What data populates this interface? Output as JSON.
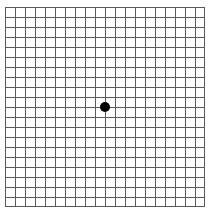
{
  "chart": {
    "name": "Amsler grid",
    "title": "Amsler Grid",
    "type": "grid-chart",
    "background_color": "#ffffff",
    "line_color": "#5a5a5a",
    "border_color": "#5a5a5a",
    "dot_color": "#000000"
  },
  "grid": {
    "columns": 20,
    "rows": 20,
    "cell_width_px": 10,
    "cell_height_px": 10,
    "origin_x_px": 5,
    "origin_y_px": 7,
    "width_px": 200,
    "height_px": 200,
    "line_width_px": 1,
    "border_width_px": 1
  },
  "fixation_dot": {
    "label": "central fixation dot",
    "center_x_px": 105,
    "center_y_px": 107,
    "diameter_px": 10
  },
  "chart_data": {
    "type": "grid",
    "title": "Amsler Grid",
    "subtitle": "",
    "xlabel": "",
    "ylabel": "",
    "grid": true,
    "legend_position": "none",
    "columns": 20,
    "rows": 20,
    "x": [
      0,
      1,
      2,
      3,
      4,
      5,
      6,
      7,
      8,
      9,
      10,
      11,
      12,
      13,
      14,
      15,
      16,
      17,
      18,
      19,
      20
    ],
    "y": [
      0,
      1,
      2,
      3,
      4,
      5,
      6,
      7,
      8,
      9,
      10,
      11,
      12,
      13,
      14,
      15,
      16,
      17,
      18,
      19,
      20
    ],
    "xlim": [
      0,
      20
    ],
    "ylim": [
      0,
      20
    ],
    "annotations": [
      {
        "label": "central fixation dot",
        "x": 10,
        "y": 10,
        "marker": "filled-circle",
        "color": "#000000",
        "size_cells": 1
      }
    ],
    "series": [
      {
        "name": "vertical gridlines",
        "orientation": "vertical",
        "values": [
          0,
          1,
          2,
          3,
          4,
          5,
          6,
          7,
          8,
          9,
          10,
          11,
          12,
          13,
          14,
          15,
          16,
          17,
          18,
          19,
          20
        ]
      },
      {
        "name": "horizontal gridlines",
        "orientation": "horizontal",
        "values": [
          0,
          1,
          2,
          3,
          4,
          5,
          6,
          7,
          8,
          9,
          10,
          11,
          12,
          13,
          14,
          15,
          16,
          17,
          18,
          19,
          20
        ]
      }
    ]
  }
}
